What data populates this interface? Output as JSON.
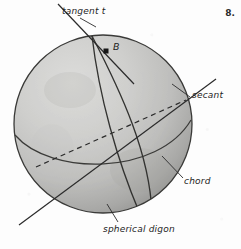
{
  "figure": {
    "number": "8.",
    "background_color": "#fdfdfd",
    "ink_color": "#2b2b2b",
    "sphere": {
      "center_x": 103,
      "center_y": 124,
      "radius": 89,
      "fill_light": "#d8d8d6",
      "fill_mid": "#b9b9b7",
      "fill_dark": "#949492",
      "outline_color": "#3a3a38"
    },
    "point": {
      "name": "B",
      "label": "B",
      "x": 107,
      "y": 52,
      "marker": "filled-square"
    },
    "labels": {
      "tangent": "tangent t",
      "secant": "secant",
      "chord": "chord",
      "spherical_digon": "spherical digon"
    },
    "elements": [
      {
        "name": "tangent-line",
        "label": "tangent t",
        "style": "solid",
        "description": "straight line touching sphere at point B"
      },
      {
        "name": "secant-line",
        "label": "secant",
        "style": "solid",
        "description": "straight line cutting through the sphere"
      },
      {
        "name": "chord-line",
        "label": "chord",
        "style": "dashed",
        "description": "dashed straight segment joining two points of the sphere"
      },
      {
        "name": "spherical-digon",
        "label": "spherical digon",
        "style": "solid",
        "description": "lune bounded by two great-circle arcs meeting at B"
      },
      {
        "name": "equator-arc",
        "label": "",
        "style": "solid",
        "description": "great circle drawn across the sphere"
      }
    ]
  }
}
